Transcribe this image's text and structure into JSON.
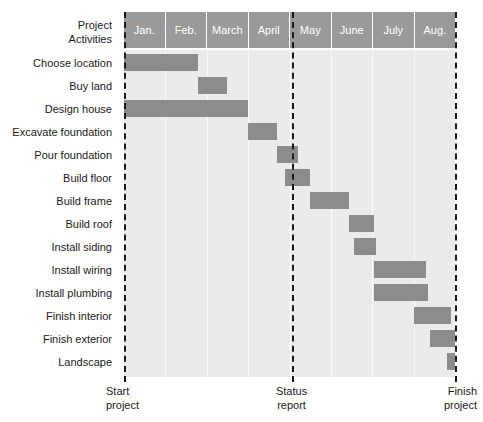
{
  "header": {
    "corner_line1": "Project",
    "corner_line2": "Activities"
  },
  "months": [
    {
      "label": "Jan."
    },
    {
      "label": "Feb."
    },
    {
      "label": "March"
    },
    {
      "label": "April"
    },
    {
      "label": "May"
    },
    {
      "label": "June"
    },
    {
      "label": "July"
    },
    {
      "label": "Aug."
    }
  ],
  "activities": [
    {
      "label": "Choose location",
      "start": 0.0,
      "end": 1.8
    },
    {
      "label": "Buy land",
      "start": 1.8,
      "end": 2.5
    },
    {
      "label": "Design house",
      "start": 0.0,
      "end": 3.0
    },
    {
      "label": "Excavate foundation",
      "start": 3.0,
      "end": 3.7
    },
    {
      "label": "Pour foundation",
      "start": 3.7,
      "end": 4.2
    },
    {
      "label": "Build floor",
      "start": 3.9,
      "end": 4.5
    },
    {
      "label": "Build frame",
      "start": 4.5,
      "end": 5.45
    },
    {
      "label": "Build roof",
      "start": 5.45,
      "end": 6.05
    },
    {
      "label": "Install siding",
      "start": 5.55,
      "end": 6.1
    },
    {
      "label": "Install wiring",
      "start": 6.05,
      "end": 7.3
    },
    {
      "label": "Install plumbing",
      "start": 6.05,
      "end": 7.35
    },
    {
      "label": "Finish interior",
      "start": 7.0,
      "end": 7.9
    },
    {
      "label": "Finish exterior",
      "start": 7.4,
      "end": 8.0
    },
    {
      "label": "Landscape",
      "start": 7.8,
      "end": 8.0
    }
  ],
  "milestones": [
    {
      "at_month": 0.0,
      "line1": "Start",
      "line2": "project",
      "align": "mc-left"
    },
    {
      "at_month": 4.05,
      "line1": "Status",
      "line2": "report",
      "align": "mc-center"
    },
    {
      "at_month": 8.0,
      "line1": "Finish",
      "line2": "project",
      "align": "mc-right"
    }
  ],
  "colors": {
    "bar": "#8c8c8c",
    "header_band": "#9a9a9a",
    "plot_background": "#ebebeb",
    "gridline": "#fafafa",
    "text": "#1a1a1a"
  },
  "chart_data": {
    "type": "bar",
    "title": "",
    "xlabel": "",
    "ylabel": "Project Activities",
    "orientation": "horizontal-gantt",
    "x_tick_labels": [
      "Jan.",
      "Feb.",
      "March",
      "April",
      "May",
      "June",
      "July",
      "Aug."
    ],
    "xlim": [
      0,
      8
    ],
    "grid": true,
    "legend": "none",
    "categories": [
      "Choose location",
      "Buy land",
      "Design house",
      "Excavate foundation",
      "Pour foundation",
      "Build floor",
      "Build frame",
      "Build roof",
      "Install siding",
      "Install wiring",
      "Install plumbing",
      "Finish interior",
      "Finish exterior",
      "Landscape"
    ],
    "series": [
      {
        "name": "Task duration (months from Jan 1)",
        "bars": [
          {
            "category": "Choose location",
            "start": 0.0,
            "end": 1.8,
            "duration": 1.8
          },
          {
            "category": "Buy land",
            "start": 1.8,
            "end": 2.5,
            "duration": 0.7
          },
          {
            "category": "Design house",
            "start": 0.0,
            "end": 3.0,
            "duration": 3.0
          },
          {
            "category": "Excavate foundation",
            "start": 3.0,
            "end": 3.7,
            "duration": 0.7
          },
          {
            "category": "Pour foundation",
            "start": 3.7,
            "end": 4.2,
            "duration": 0.5
          },
          {
            "category": "Build floor",
            "start": 3.9,
            "end": 4.5,
            "duration": 0.6
          },
          {
            "category": "Build frame",
            "start": 4.5,
            "end": 5.45,
            "duration": 0.95
          },
          {
            "category": "Build roof",
            "start": 5.45,
            "end": 6.05,
            "duration": 0.6
          },
          {
            "category": "Install siding",
            "start": 5.55,
            "end": 6.1,
            "duration": 0.55
          },
          {
            "category": "Install wiring",
            "start": 6.05,
            "end": 7.3,
            "duration": 1.25
          },
          {
            "category": "Install plumbing",
            "start": 6.05,
            "end": 7.35,
            "duration": 1.3
          },
          {
            "category": "Finish interior",
            "start": 7.0,
            "end": 7.9,
            "duration": 0.9
          },
          {
            "category": "Finish exterior",
            "start": 7.4,
            "end": 8.0,
            "duration": 0.6
          },
          {
            "category": "Landscape",
            "start": 7.8,
            "end": 8.0,
            "duration": 0.2
          }
        ]
      }
    ],
    "annotations": [
      {
        "label": "Start project",
        "at_month": 0.0,
        "type": "vertical-dashed-line"
      },
      {
        "label": "Status report",
        "at_month": 4.05,
        "type": "vertical-dashed-line"
      },
      {
        "label": "Finish project",
        "at_month": 8.0,
        "type": "vertical-dashed-line"
      }
    ]
  }
}
